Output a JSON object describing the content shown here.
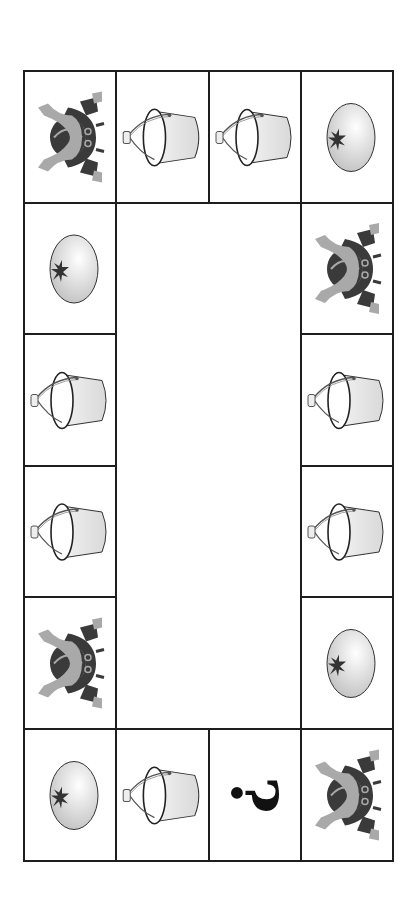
{
  "puzzle": {
    "title": "Pattern ring puzzle",
    "grid": {
      "columns": 4,
      "rows": 6
    },
    "symbols": {
      "helmet": "samurai-helmet-icon",
      "bucket": "bucket-icon",
      "tomato": "tomato-icon",
      "unknown": "question-mark"
    },
    "question_text": "?",
    "cells": [
      {
        "row": 0,
        "col": 0,
        "item": "helmet"
      },
      {
        "row": 0,
        "col": 1,
        "item": "bucket"
      },
      {
        "row": 0,
        "col": 2,
        "item": "bucket"
      },
      {
        "row": 0,
        "col": 3,
        "item": "tomato"
      },
      {
        "row": 1,
        "col": 0,
        "item": "tomato"
      },
      {
        "row": 1,
        "col": 3,
        "item": "helmet"
      },
      {
        "row": 2,
        "col": 0,
        "item": "bucket"
      },
      {
        "row": 2,
        "col": 3,
        "item": "bucket"
      },
      {
        "row": 3,
        "col": 0,
        "item": "bucket"
      },
      {
        "row": 3,
        "col": 3,
        "item": "bucket"
      },
      {
        "row": 4,
        "col": 0,
        "item": "helmet"
      },
      {
        "row": 4,
        "col": 3,
        "item": "tomato"
      },
      {
        "row": 5,
        "col": 0,
        "item": "tomato"
      },
      {
        "row": 5,
        "col": 1,
        "item": "bucket"
      },
      {
        "row": 5,
        "col": 2,
        "item": "unknown"
      },
      {
        "row": 5,
        "col": 3,
        "item": "helmet"
      }
    ],
    "colors": {
      "line": "#1e1e1e",
      "helmet_light": "#a9a9a9",
      "helmet_dark": "#3a3a3a",
      "bucket_fill": "#d9d9d9",
      "tomato_fill": "#dcdcdc",
      "ink": "#111111"
    }
  }
}
